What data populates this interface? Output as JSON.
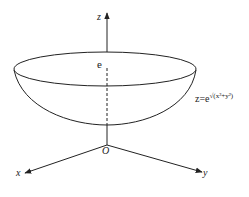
{
  "diagram": {
    "type": "3d-surface-sketch",
    "axes": {
      "x_label": "x",
      "y_label": "y",
      "z_label": "z",
      "origin_label": "O"
    },
    "annotations": {
      "top_point_label": "e",
      "surface_equation_prefix": "z=e",
      "surface_equation_exponent": "√(x²+y²)"
    },
    "colors": {
      "stroke": "#222222",
      "background": "#ffffff"
    }
  }
}
